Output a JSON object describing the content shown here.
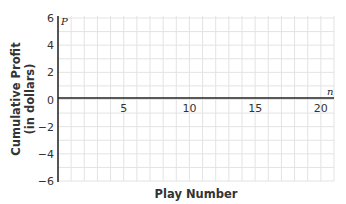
{
  "chart_data": {
    "type": "line",
    "title": "",
    "xlabel": "Play Number",
    "ylabel": "Cumulative Profit (in dollars)",
    "ylabel_lines": [
      "Cumulative Profit",
      "(in dollars)"
    ],
    "x_variable": "n",
    "y_variable": "P",
    "xlim": [
      0,
      21
    ],
    "ylim": [
      -6,
      6
    ],
    "x_ticks": [
      5,
      10,
      15,
      20
    ],
    "y_ticks": [
      6,
      4,
      2,
      0,
      -2,
      -4,
      -6
    ],
    "y_tick_labels": [
      "6",
      "4",
      "2",
      "0",
      "−2",
      "−4",
      "−6"
    ],
    "grid": true,
    "grid_step": 1,
    "series": []
  }
}
